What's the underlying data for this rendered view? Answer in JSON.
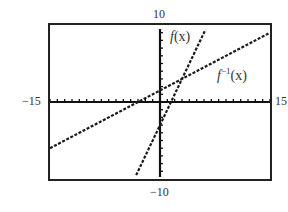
{
  "chart_data": {
    "type": "line",
    "title": "",
    "xlabel": "",
    "ylabel": "",
    "xlim": [
      -15,
      15
    ],
    "ylim": [
      -10,
      10
    ],
    "x_tick_step": 1,
    "y_tick_step": 1,
    "grid": false,
    "legend_position": "inline labels",
    "window_labels": {
      "xmin": "−15",
      "xmax": "15",
      "ymax": "10",
      "ymin": "−10"
    },
    "series": [
      {
        "name": "f(x)",
        "label_main": "f",
        "label_sup": "",
        "label_arg": "(x)",
        "expression": "2x - 3",
        "slope": 2,
        "intercept": -3,
        "style": "dashed",
        "x": [
          -3.5,
          0,
          1.5,
          3,
          6.5
        ],
        "y": [
          -10,
          -3,
          0,
          3,
          10
        ]
      },
      {
        "name": "f^-1(x)",
        "label_main": "f",
        "label_sup": "−1",
        "label_arg": "(x)",
        "expression": "(x + 3) / 2",
        "slope": 0.5,
        "intercept": 1.5,
        "style": "dashed",
        "x": [
          -15,
          -3,
          0,
          3,
          15
        ],
        "y": [
          -6,
          0,
          1.5,
          3,
          9
        ]
      }
    ],
    "annotations": [
      {
        "text": "f(x)",
        "near": [
          2.3,
          8
        ]
      },
      {
        "text": "f−1(x)",
        "near": [
          10,
          4.5
        ]
      }
    ],
    "colors": {
      "frame": "#222222",
      "axes": "#111111",
      "lines": "#1a1a1a",
      "text": "#333333"
    }
  }
}
